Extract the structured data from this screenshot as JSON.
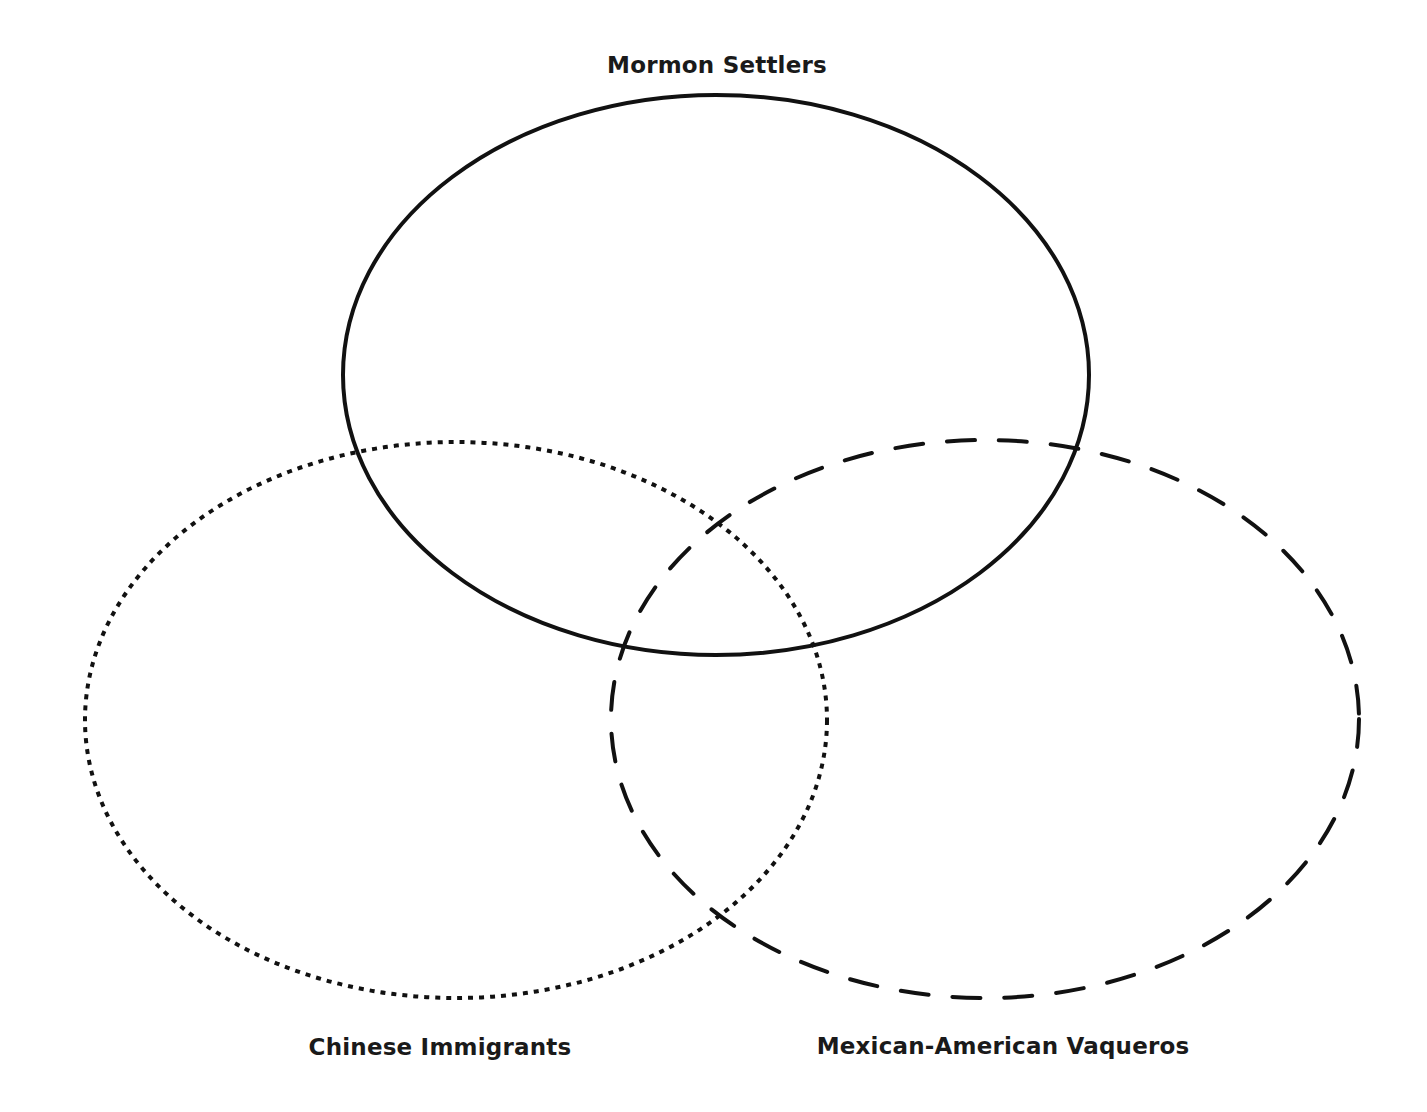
{
  "diagram": {
    "type": "venn",
    "background": "#ffffff",
    "stroke_color": "#111111",
    "sets": [
      {
        "id": "mormon",
        "label": "Mormon Settlers",
        "line_style": "solid",
        "cx": 716,
        "cy": 375,
        "rx": 373,
        "ry": 280,
        "label_x": 717,
        "label_y": 52
      },
      {
        "id": "chinese",
        "label": "Chinese Immigrants",
        "line_style": "dotted",
        "cx": 456,
        "cy": 720,
        "rx": 371,
        "ry": 278,
        "label_x": 440,
        "label_y": 1034
      },
      {
        "id": "vaqueros",
        "label": "Mexican-American Vaqueros",
        "line_style": "dashed",
        "cx": 985,
        "cy": 719,
        "rx": 374,
        "ry": 279,
        "label_x": 1003,
        "label_y": 1033
      }
    ]
  }
}
